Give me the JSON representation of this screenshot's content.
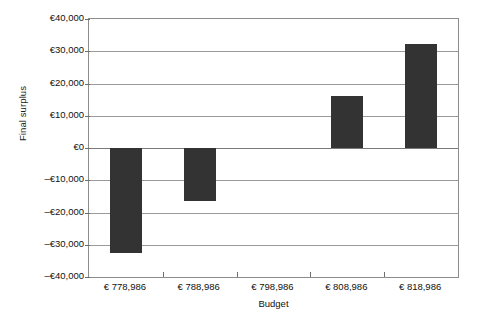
{
  "chart_data": {
    "type": "bar",
    "title": "",
    "xlabel": "Budget",
    "ylabel": "Final surplus",
    "categories": [
      "€ 778,986",
      "€ 788,986",
      "€ 798,986",
      "€ 808,986",
      "€ 818,986"
    ],
    "values": [
      -32600,
      -16300,
      0,
      16200,
      32400
    ],
    "ylim": [
      -40000,
      40000
    ],
    "ytick_values": [
      40000,
      30000,
      20000,
      10000,
      0,
      -10000,
      -20000,
      -30000,
      -40000
    ],
    "ytick_labels": [
      "€40,000",
      "€30,000",
      "€20,000",
      "€10,000",
      "€0",
      "–€10,000",
      "–€20,000",
      "–€30,000",
      "–€40,000"
    ],
    "grid": true,
    "legend": "none",
    "bar_color": "#333333",
    "axis_color": "#8c8c8c",
    "gridline_color": "#9a9a9a",
    "background": "#ffffff"
  }
}
